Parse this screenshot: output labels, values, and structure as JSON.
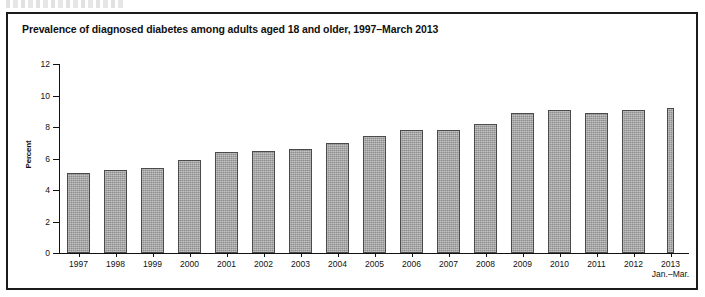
{
  "figure": {
    "title": "Prevalence of diagnosed diabetes among adults aged 18 and older, 1997–March 2013",
    "border_color": "#1b1b1b"
  },
  "chart_data": {
    "type": "bar",
    "title": "Prevalence of diagnosed diabetes among adults aged 18 and older, 1997–March 2013",
    "xlabel": "",
    "ylabel": "Percent",
    "ylim": [
      0,
      12
    ],
    "yticks": [
      0,
      2,
      4,
      6,
      8,
      10,
      12
    ],
    "ytick_labels": [
      "0",
      "2",
      "4",
      "6",
      "8",
      "10",
      "12"
    ],
    "grid": false,
    "legend": "none",
    "bar_color": "#8d8d8d",
    "bar_edge_color": "#4a4a4a",
    "categories": [
      "1997",
      "1998",
      "1999",
      "2000",
      "2001",
      "2002",
      "2003",
      "2004",
      "2005",
      "2006",
      "2007",
      "2008",
      "2009",
      "2010",
      "2011",
      "2012",
      "2013"
    ],
    "category_sublabels": [
      "",
      "",
      "",
      "",
      "",
      "",
      "",
      "",
      "",
      "",
      "",
      "",
      "",
      "",
      "",
      "",
      "Jan.–Mar."
    ],
    "values": [
      5.1,
      5.3,
      5.4,
      5.9,
      6.4,
      6.5,
      6.6,
      7.0,
      7.4,
      7.8,
      7.8,
      8.2,
      8.9,
      9.1,
      8.9,
      9.1,
      9.2
    ],
    "bar_widths_rel": [
      1,
      1,
      1,
      1,
      1,
      1,
      1,
      1,
      1,
      1,
      1,
      1,
      1,
      1,
      1,
      1,
      0.28
    ],
    "series": [
      {
        "name": "Percent with diagnosed diabetes",
        "values": [
          5.1,
          5.3,
          5.4,
          5.9,
          6.4,
          6.5,
          6.6,
          7.0,
          7.4,
          7.8,
          7.8,
          8.2,
          8.9,
          9.1,
          8.9,
          9.1,
          9.2
        ]
      }
    ]
  }
}
